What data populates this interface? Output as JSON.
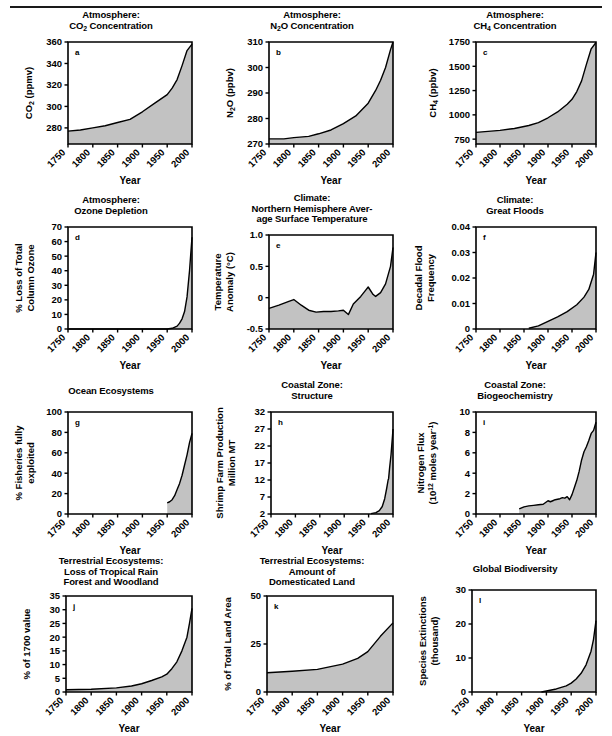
{
  "figure": {
    "x_axis_label": "Year",
    "x_ticks": [
      1750,
      1800,
      1850,
      1900,
      1950,
      2000
    ],
    "fill_color": "#c2c2c2",
    "line_color": "#000000"
  },
  "chart_data": [
    {
      "id": "a",
      "panel_letter": "a",
      "type": "area",
      "title": "Atmosphere:\nCO2 Concentration",
      "title_lines": [
        "Atmosphere:",
        "CO₂ Concentration"
      ],
      "xlabel": "Year",
      "ylabel": "CO2 (ppmv)",
      "ylabel_lines": [
        "CO₂ (ppmv)"
      ],
      "xlim": [
        1750,
        2000
      ],
      "ylim": [
        265,
        360
      ],
      "yticks": [
        280,
        300,
        320,
        340,
        360
      ],
      "xticks": [
        1750,
        1800,
        1850,
        1900,
        1950,
        2000
      ],
      "x": [
        1750,
        1775,
        1800,
        1825,
        1850,
        1875,
        1900,
        1925,
        1950,
        1960,
        1970,
        1980,
        1990,
        2000
      ],
      "values": [
        277,
        278,
        280,
        282,
        285,
        288,
        295,
        303,
        311,
        317,
        325,
        338,
        352,
        358
      ]
    },
    {
      "id": "b",
      "panel_letter": "b",
      "type": "area",
      "title": "Atmosphere:\nN2O Concentration",
      "title_lines": [
        "Atmosphere:",
        "N₂O Concentration"
      ],
      "xlabel": "Year",
      "ylabel": "N2O (ppbv)",
      "ylabel_lines": [
        "N₂O  (ppbv)"
      ],
      "xlim": [
        1750,
        2000
      ],
      "ylim": [
        270,
        310
      ],
      "yticks": [
        270,
        280,
        290,
        300,
        310
      ],
      "xticks": [
        1750,
        1800,
        1850,
        1900,
        1950,
        2000
      ],
      "x": [
        1750,
        1780,
        1800,
        1830,
        1850,
        1875,
        1900,
        1925,
        1950,
        1965,
        1975,
        1985,
        1995,
        2000
      ],
      "values": [
        272,
        272,
        272.5,
        273,
        274,
        275.5,
        278,
        281,
        286,
        291,
        295,
        300,
        307,
        310
      ]
    },
    {
      "id": "c",
      "panel_letter": "c",
      "type": "area",
      "title": "Atmosphere:\nCH4 Concentration",
      "title_lines": [
        "Atmosphere:",
        "CH₄ Concentration"
      ],
      "xlabel": "Year",
      "ylabel": "CH4 (ppbv)",
      "ylabel_lines": [
        "CH₄ (ppbv)"
      ],
      "xlim": [
        1750,
        2000
      ],
      "ylim": [
        700,
        1750
      ],
      "yticks": [
        750,
        1000,
        1250,
        1500,
        1750
      ],
      "xticks": [
        1750,
        1800,
        1850,
        1900,
        1950,
        2000
      ],
      "x": [
        1750,
        1800,
        1830,
        1860,
        1880,
        1900,
        1920,
        1940,
        1950,
        1960,
        1970,
        1980,
        1990,
        2000
      ],
      "values": [
        820,
        840,
        860,
        890,
        920,
        970,
        1030,
        1110,
        1160,
        1240,
        1350,
        1520,
        1680,
        1745
      ]
    },
    {
      "id": "d",
      "panel_letter": "d",
      "type": "area",
      "title": "Atmosphere:\nOzone Depletion",
      "title_lines": [
        "Atmosphere:",
        "Ozone Depletion"
      ],
      "xlabel": "Year",
      "ylabel": "% Loss of Total Column Ozone",
      "ylabel_lines": [
        "% Loss of Total",
        "Column Ozone"
      ],
      "xlim": [
        1750,
        2000
      ],
      "ylim": [
        0,
        70
      ],
      "yticks": [
        0,
        10,
        20,
        30,
        40,
        50,
        60,
        70
      ],
      "xticks": [
        1750,
        1800,
        1850,
        1900,
        1950,
        2000
      ],
      "x": [
        1750,
        1900,
        1950,
        1960,
        1970,
        1975,
        1980,
        1985,
        1990,
        1995,
        2000
      ],
      "values": [
        0,
        0,
        0,
        0.5,
        2,
        4,
        7,
        12,
        22,
        40,
        63
      ]
    },
    {
      "id": "e",
      "panel_letter": "e",
      "type": "area",
      "title": "Climate:\nNorthern Hemisphere Average Surface Temperature",
      "title_lines": [
        "Climate:",
        "Northern Hemisphere Aver-",
        "age Surface Temperature"
      ],
      "xlabel": "Year",
      "ylabel": "Temperature Anomaly (°C)",
      "ylabel_lines": [
        "Temperature",
        "Anomaly (°C)"
      ],
      "xlim": [
        1750,
        2000
      ],
      "ylim": [
        -0.5,
        1.0
      ],
      "yticks": [
        -0.5,
        0,
        0.5,
        1.0
      ],
      "ytick_labels": [
        "-0.5",
        "0",
        "0.5",
        "1.0"
      ],
      "xticks": [
        1750,
        1800,
        1850,
        1900,
        1950,
        2000
      ],
      "x": [
        1750,
        1770,
        1790,
        1800,
        1815,
        1830,
        1845,
        1860,
        1875,
        1890,
        1900,
        1910,
        1920,
        1935,
        1945,
        1950,
        1960,
        1965,
        1975,
        1985,
        1995,
        2000
      ],
      "values": [
        -0.17,
        -0.12,
        -0.06,
        -0.03,
        -0.12,
        -0.2,
        -0.23,
        -0.22,
        -0.22,
        -0.21,
        -0.2,
        -0.27,
        -0.1,
        0.02,
        0.12,
        0.17,
        0.05,
        0.02,
        0.08,
        0.22,
        0.5,
        0.8
      ]
    },
    {
      "id": "f",
      "panel_letter": "f",
      "type": "area",
      "title": "Climate:\nGreat Floods",
      "title_lines": [
        "Climate:",
        "Great Floods"
      ],
      "xlabel": "Year",
      "ylabel": "Decadal Flood Frequency",
      "ylabel_lines": [
        "Decadal Flood",
        "Frequency"
      ],
      "xlim": [
        1750,
        2000
      ],
      "ylim": [
        0,
        0.04
      ],
      "yticks": [
        0,
        0.01,
        0.02,
        0.03,
        0.04
      ],
      "ytick_labels": [
        "0",
        "0.01",
        "0.02",
        "0.03",
        "0.04"
      ],
      "xticks": [
        1750,
        1800,
        1850,
        1900,
        1950,
        2000
      ],
      "x": [
        1860,
        1880,
        1900,
        1920,
        1940,
        1960,
        1975,
        1985,
        1995,
        2000
      ],
      "values": [
        0.0003,
        0.0012,
        0.003,
        0.0048,
        0.0068,
        0.0095,
        0.0125,
        0.0155,
        0.0215,
        0.03
      ]
    },
    {
      "id": "g",
      "panel_letter": "g",
      "type": "area",
      "title": "Ocean Ecosystems",
      "title_lines": [
        "Ocean Ecosystems"
      ],
      "xlabel": "Year",
      "ylabel": "% Fisheries fully exploited",
      "ylabel_lines": [
        "% Fisheries fully",
        "exploited"
      ],
      "xlim": [
        1750,
        2000
      ],
      "ylim": [
        0,
        100
      ],
      "yticks": [
        0,
        20,
        40,
        60,
        80,
        100
      ],
      "xticks": [
        1750,
        1800,
        1850,
        1900,
        1950,
        2000
      ],
      "x": [
        1950,
        1955,
        1960,
        1965,
        1970,
        1975,
        1980,
        1985,
        1990,
        1995,
        2000
      ],
      "values": [
        11,
        12,
        14,
        18,
        24,
        30,
        38,
        48,
        58,
        70,
        79
      ]
    },
    {
      "id": "h",
      "panel_letter": "h",
      "type": "area",
      "title": "Coastal Zone:\nStructure",
      "title_lines": [
        "Coastal Zone:",
        "Structure"
      ],
      "xlabel": "Year",
      "ylabel": "Shrimp Farm Production Million MT",
      "ylabel_lines": [
        "Shrimp Farm Production",
        "Million MT"
      ],
      "xlim": [
        1750,
        2000
      ],
      "ylim": [
        2,
        32
      ],
      "yticks": [
        2,
        7,
        12,
        17,
        22,
        27,
        32
      ],
      "xticks": [
        1750,
        1800,
        1850,
        1900,
        1950,
        2000
      ],
      "x": [
        1955,
        1965,
        1972,
        1978,
        1983,
        1987,
        1990,
        1991,
        1993,
        1996,
        1999,
        2000
      ],
      "values": [
        2.1,
        2.4,
        3.0,
        4.2,
        6.5,
        9.5,
        12.0,
        12.4,
        15.5,
        19.5,
        25.0,
        27.0
      ]
    },
    {
      "id": "i",
      "panel_letter": "i",
      "type": "area",
      "title": "Coastal Zone:\nBiogeochemistry",
      "title_lines": [
        "Coastal Zone:",
        "Biogeochemistry"
      ],
      "xlabel": "Year",
      "ylabel": "Nitrogen Flux (10^12 moles year^-1)",
      "ylabel_lines": [
        "Nitrogen Flux",
        "(10¹² moles year⁻¹)"
      ],
      "xlim": [
        1750,
        2000
      ],
      "ylim": [
        0,
        10
      ],
      "yticks": [
        0,
        2,
        4,
        6,
        8,
        10
      ],
      "xticks": [
        1750,
        1800,
        1850,
        1900,
        1950,
        2000
      ],
      "x": [
        1840,
        1850,
        1860,
        1870,
        1880,
        1890,
        1900,
        1905,
        1910,
        1915,
        1920,
        1925,
        1930,
        1935,
        1940,
        1945,
        1950,
        1955,
        1960,
        1965,
        1970,
        1975,
        1980,
        1985,
        1990,
        1995,
        2000
      ],
      "values": [
        0.5,
        0.7,
        0.8,
        0.85,
        0.9,
        0.95,
        1.3,
        1.2,
        1.3,
        1.4,
        1.45,
        1.5,
        1.6,
        1.55,
        1.7,
        1.4,
        1.9,
        2.6,
        3.3,
        4.2,
        5.3,
        6.1,
        6.6,
        7.2,
        7.9,
        8.2,
        9.0
      ]
    },
    {
      "id": "j",
      "panel_letter": "j",
      "type": "area",
      "title": "Terrestrial Ecosystems:\nLoss of Tropical Rain Forest and Woodland",
      "title_lines": [
        "Terrestrial Ecosystems:",
        "Loss of Tropical Rain",
        "Forest and Woodland"
      ],
      "xlabel": "Year",
      "ylabel": "% of 1700 value",
      "ylabel_lines": [
        "% of 1700 value"
      ],
      "xlim": [
        1750,
        2000
      ],
      "ylim": [
        0,
        35
      ],
      "yticks": [
        0,
        5,
        10,
        15,
        20,
        25,
        30,
        35
      ],
      "xticks": [
        1750,
        1800,
        1850,
        1900,
        1950,
        2000
      ],
      "x": [
        1750,
        1800,
        1850,
        1880,
        1900,
        1920,
        1940,
        1950,
        1960,
        1970,
        1980,
        1990,
        1995,
        2000
      ],
      "values": [
        0.8,
        1.0,
        1.5,
        2.2,
        3.0,
        4.2,
        5.5,
        6.5,
        8.5,
        11.0,
        15.0,
        20.0,
        25.0,
        30.5
      ]
    },
    {
      "id": "k",
      "panel_letter": "k",
      "type": "area",
      "title": "Terrestrial Ecosystems:\nAmount of Domesticated Land",
      "title_lines": [
        "Terrestrial Ecosystems:",
        "Amount of",
        "Domesticated Land"
      ],
      "xlabel": "Year",
      "ylabel": "% of Total Land Area",
      "ylabel_lines": [
        "% of Total Land Area"
      ],
      "xlim": [
        1750,
        2000
      ],
      "ylim": [
        0,
        50
      ],
      "yticks": [
        0,
        25,
        50
      ],
      "xticks": [
        1750,
        1800,
        1850,
        1900,
        1950,
        2000
      ],
      "x": [
        1750,
        1800,
        1850,
        1900,
        1930,
        1950,
        1975,
        2000
      ],
      "values": [
        10,
        10.8,
        11.8,
        14.5,
        17.5,
        21,
        29,
        36
      ]
    },
    {
      "id": "l",
      "panel_letter": "l",
      "type": "area",
      "title": "Global Biodiversity",
      "title_lines": [
        "Global Biodiversity"
      ],
      "xlabel": "Year",
      "ylabel": "Species Extinctions (thousand)",
      "ylabel_lines": [
        "Species Extinctions",
        "(thousand)"
      ],
      "xlim": [
        1750,
        2000
      ],
      "ylim": [
        0,
        30
      ],
      "yticks": [
        0,
        10,
        20,
        30
      ],
      "xticks": [
        1750,
        1800,
        1850,
        1900,
        1950,
        2000
      ],
      "x": [
        1890,
        1900,
        1920,
        1940,
        1950,
        1960,
        1970,
        1980,
        1990,
        1995,
        2000
      ],
      "values": [
        0,
        0.3,
        0.9,
        1.8,
        2.6,
        3.8,
        5.5,
        8.0,
        12.0,
        15.5,
        21.0
      ]
    }
  ]
}
